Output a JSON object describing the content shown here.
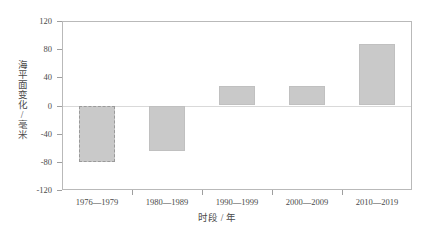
{
  "chart_data": {
    "type": "bar",
    "title": "",
    "xlabel": "时段 / 年",
    "ylabel": "海平面变化/毫米",
    "categories": [
      "1976—1979",
      "1980—1989",
      "1990—1999",
      "2000—2009",
      "2010—2019"
    ],
    "values": [
      -80,
      -65,
      27,
      27,
      88
    ],
    "ylim": [
      -120,
      120
    ],
    "yticks": [
      "120",
      "80",
      "40",
      "0",
      "-40",
      "-80",
      "-120"
    ],
    "ytick_values": [
      120,
      80,
      40,
      0,
      -40,
      -80,
      -120
    ],
    "grid": false,
    "legend": "none",
    "series": [
      {
        "name": "海平面变化",
        "values": [
          -80,
          -65,
          27,
          27,
          88
        ]
      }
    ],
    "bar_styles": [
      "dashed",
      "solid",
      "solid",
      "solid",
      "solid"
    ],
    "colors": {
      "bar_fill": "#c9c9c9",
      "bar_border_solid": "#c0c0c0",
      "bar_border_dashed": "#9a9a9a",
      "axis": "#b9b9b9",
      "text": "#4a4a4a",
      "zero_line": "#d9d9d9",
      "background": "#ffffff"
    }
  }
}
